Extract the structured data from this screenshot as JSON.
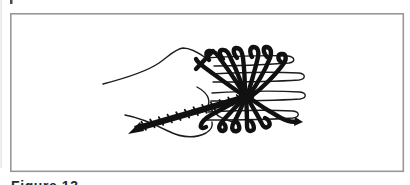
{
  "colors": {
    "paper": "#ffffff",
    "ink": "#1c1c1c",
    "thread": "#111111",
    "frame": "#98989a"
  },
  "figure": {
    "caption": "Figure 13",
    "alt": "Line drawing of a hand with dark thread wound over four extended fingers; the strands converge in a central knot crossed by a diagonal whipped band"
  }
}
